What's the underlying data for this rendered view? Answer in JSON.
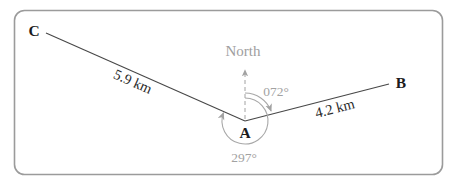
{
  "diagram": {
    "north_label": "North",
    "points": {
      "a": "A",
      "b": "B",
      "c": "C"
    },
    "distances": {
      "ab": "4.2 km",
      "ac": "5.9 km"
    },
    "bearings": {
      "ab": "072°",
      "ac": "297°"
    },
    "colors": {
      "survey_line": "#474747",
      "annotation_gray": "#a2a2a2",
      "point_label": "#1c1c1c",
      "frame_border": "#9b9b9b",
      "background": "#ffffff"
    }
  }
}
